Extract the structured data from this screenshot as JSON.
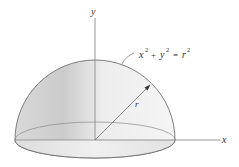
{
  "figure": {
    "type": "hemisphere-diagram",
    "axes": {
      "y_label": "y",
      "x_label": "x"
    },
    "equation_label": {
      "x": "x",
      "y": "y",
      "r": "r",
      "exp": "2",
      "plus": "+",
      "equals": "="
    },
    "radius_label": "r",
    "colors": {
      "outline": "#7a7a7a",
      "axis": "#8a8a8a",
      "fill_light": "#f2f2f2",
      "fill_dark": "#cfcfcf",
      "base_fill": "#e6e6e6"
    }
  }
}
